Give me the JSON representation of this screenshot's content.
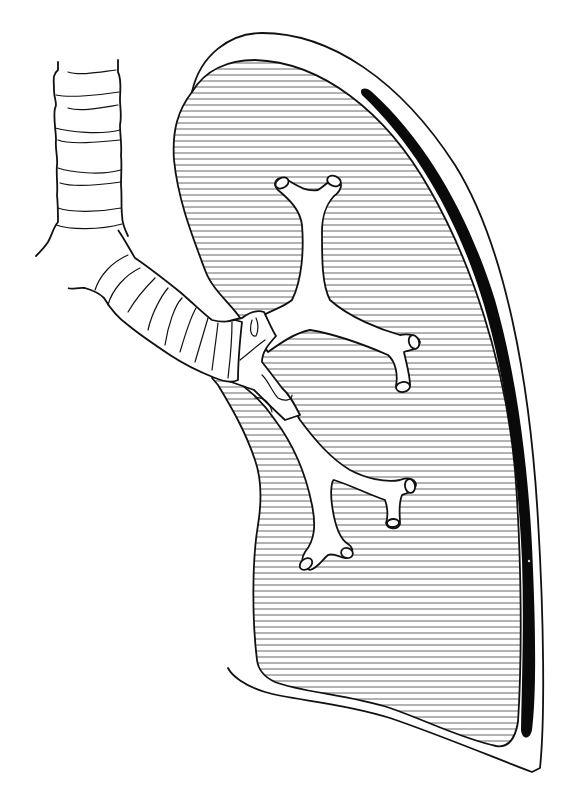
{
  "figure": {
    "type": "anatomical-line-drawing",
    "colors": {
      "background": "#ffffff",
      "line": "#111111",
      "hatch": "#555555",
      "pleural_band": "#0a0a0a"
    },
    "hatch_spacing_px": 6,
    "parts": [
      {
        "id": "trachea",
        "label": "trachea"
      },
      {
        "id": "main-bronchus",
        "label": "main bronchus"
      },
      {
        "id": "upper-lobe-bronchus",
        "label": "upper bronchus branch"
      },
      {
        "id": "lower-lobe-bronchus",
        "label": "lower bronchus branch"
      },
      {
        "id": "lung-parenchyma",
        "label": "lung (hatched)"
      },
      {
        "id": "visceral-pleura",
        "label": "inner pleural outline"
      },
      {
        "id": "parietal-pleura",
        "label": "outer pleural outline"
      },
      {
        "id": "pleural-space",
        "label": "dark pleural band"
      }
    ]
  }
}
